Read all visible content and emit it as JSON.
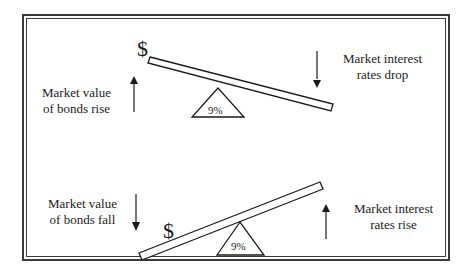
{
  "diagram": {
    "top_scenario": {
      "left_label_line1": "Market value",
      "left_label_line2": "of bonds rise",
      "left_arrow": "up",
      "right_label_line1": "Market interest",
      "right_label_line2": "rates drop",
      "right_arrow": "down",
      "plank_symbol": "$",
      "fulcrum_label": "9%"
    },
    "bottom_scenario": {
      "left_label_line1": "Market value",
      "left_label_line2": "of bonds fall",
      "left_arrow": "down",
      "right_label_line1": "Market interest",
      "right_label_line2": "rates rise",
      "right_arrow": "up",
      "plank_symbol": "$",
      "fulcrum_label": "9%"
    },
    "colors": {
      "line": "#1a1a1a",
      "border": "#3a3a3a",
      "background": "#ffffff"
    }
  }
}
